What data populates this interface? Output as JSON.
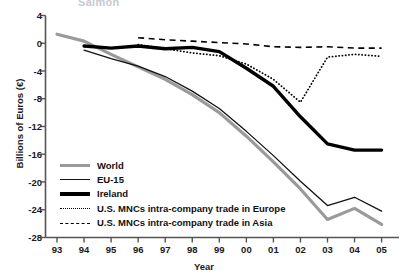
{
  "figure": {
    "clipped_header_text": "Salmon",
    "axis_color": "#555555"
  },
  "chart_data": {
    "type": "line",
    "title": "",
    "xlabel": "Year",
    "ylabel": "Billions of Euros (€)",
    "x_tick_labels": [
      "93",
      "94",
      "95",
      "96",
      "97",
      "98",
      "99",
      "00",
      "01",
      "02",
      "03",
      "04",
      "05"
    ],
    "x_values": [
      1993,
      1994,
      1995,
      1996,
      1997,
      1998,
      1999,
      2000,
      2001,
      2002,
      2003,
      2004,
      2005
    ],
    "y_tick_labels": [
      "4",
      "0",
      "-4",
      "-8",
      "-12",
      "-16",
      "-20",
      "-24",
      "-28"
    ],
    "y_ticks": [
      4,
      0,
      -4,
      -8,
      -12,
      -16,
      -20,
      -24,
      -28
    ],
    "ylim": [
      -28,
      4
    ],
    "xlim": [
      1993,
      2005
    ],
    "grid": false,
    "legend_position": "lower-left-inside",
    "series": [
      {
        "name": "World",
        "color": "#9a9a9a",
        "style": "solid",
        "width": 3.2,
        "x": [
          1993,
          1994,
          1995,
          1996,
          1997,
          1998,
          1999,
          2000,
          2001,
          2002,
          2003,
          2004,
          2005
        ],
        "values": [
          1.3,
          0.3,
          -1.6,
          -3.4,
          -5.2,
          -7.4,
          -10.0,
          -13.4,
          -17.1,
          -21.0,
          -25.4,
          -23.8,
          -26.1
        ]
      },
      {
        "name": "EU-15",
        "color": "#111111",
        "style": "solid",
        "width": 1.3,
        "x": [
          1994,
          1995,
          1996,
          1997,
          1998,
          1999,
          2000,
          2001,
          2002,
          2003,
          2004,
          2005
        ],
        "values": [
          -1.0,
          -2.2,
          -3.3,
          -4.8,
          -6.9,
          -9.4,
          -12.7,
          -16.2,
          -19.9,
          -23.4,
          -22.2,
          -24.2
        ]
      },
      {
        "name": "Ireland",
        "color": "#000000",
        "style": "solid",
        "width": 3.4,
        "x": [
          1994,
          1995,
          1996,
          1997,
          1998,
          1999,
          2000,
          2001,
          2002,
          2003,
          2004,
          2005
        ],
        "values": [
          -0.4,
          -0.7,
          -0.4,
          -0.8,
          -0.6,
          -1.2,
          -3.6,
          -6.2,
          -10.6,
          -14.5,
          -15.4,
          -15.4
        ]
      },
      {
        "name": "U.S. MNCs intra-company trade in Europe",
        "color": "#000000",
        "style": "dotted",
        "width": 1.8,
        "x": [
          1996,
          1997,
          1998,
          1999,
          2000,
          2001,
          2002,
          2003,
          2004,
          2005
        ],
        "values": [
          -0.2,
          -0.8,
          -1.4,
          -1.8,
          -3.0,
          -5.2,
          -8.5,
          -2.0,
          -1.6,
          -1.9
        ]
      },
      {
        "name": "U.S. MNCs intra-company trade in Asia",
        "color": "#000000",
        "style": "dashed",
        "width": 1.6,
        "x": [
          1996,
          1997,
          1998,
          1999,
          2000,
          2001,
          2002,
          2003,
          2004,
          2005
        ],
        "values": [
          0.8,
          0.5,
          0.3,
          0.1,
          -0.1,
          -0.5,
          -0.6,
          -0.5,
          -0.7,
          -0.7
        ]
      }
    ],
    "legend_entries": [
      {
        "label": "World",
        "swatch": "thick-gray-solid"
      },
      {
        "label": "EU-15",
        "swatch": "thin-black-solid"
      },
      {
        "label": "Ireland",
        "swatch": "thick-black-solid"
      },
      {
        "label": "U.S. MNCs intra-company trade in Europe",
        "swatch": "black-dotted"
      },
      {
        "label": "U.S. MNCs intra-company trade in Asia",
        "swatch": "black-dashed"
      }
    ]
  }
}
